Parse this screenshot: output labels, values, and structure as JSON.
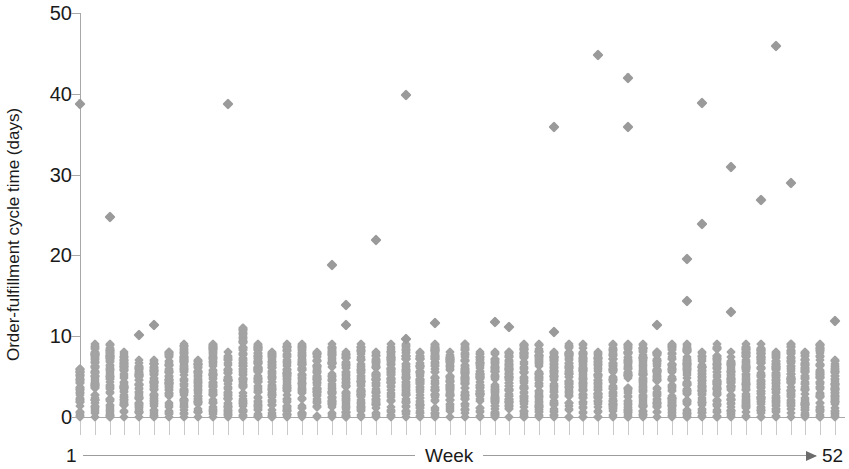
{
  "chart_data": {
    "type": "scatter",
    "title": "",
    "subtitle": "",
    "xlabel": "Week",
    "ylabel": "Order-fulfillment cycle time (days)",
    "xlim": [
      1,
      52
    ],
    "ylim": [
      0,
      50
    ],
    "x_tick_labels": [
      "1",
      "52"
    ],
    "y_tick_labels": [
      "0",
      "10",
      "20",
      "30",
      "40",
      "50"
    ],
    "y_ticks": [
      0,
      10,
      20,
      30,
      40,
      50
    ],
    "grid": false,
    "legend": null,
    "marker": "diamond",
    "marker_color": "#a3a3a3",
    "axis_color": "#a8a8a8",
    "x_axis_arrow": true,
    "cluster_tops": [
      6,
      9,
      9,
      8,
      7,
      7,
      8,
      9,
      7,
      9,
      8,
      11,
      9,
      8,
      9,
      9,
      8,
      9,
      8,
      9,
      8,
      9,
      9,
      8,
      9,
      8,
      9,
      8,
      8,
      8,
      9,
      9,
      8,
      9,
      9,
      8,
      9,
      9,
      9,
      8,
      9,
      9,
      8,
      9,
      8,
      9,
      9,
      8,
      9,
      8,
      9,
      7
    ],
    "series": [
      {
        "name": "Order-fulfillment cycle time",
        "points": [
          {
            "x": 1,
            "y": 38.7
          },
          {
            "x": 3,
            "y": 24.7
          },
          {
            "x": 5,
            "y": 10.2
          },
          {
            "x": 6,
            "y": 11.4
          },
          {
            "x": 11,
            "y": 38.7
          },
          {
            "x": 18,
            "y": 18.8
          },
          {
            "x": 19,
            "y": 13.8
          },
          {
            "x": 19,
            "y": 11.4
          },
          {
            "x": 21,
            "y": 21.9
          },
          {
            "x": 23,
            "y": 9.6
          },
          {
            "x": 23,
            "y": 39.8
          },
          {
            "x": 25,
            "y": 11.6
          },
          {
            "x": 29,
            "y": 11.7
          },
          {
            "x": 30,
            "y": 11.2
          },
          {
            "x": 33,
            "y": 35.9
          },
          {
            "x": 33,
            "y": 10.5
          },
          {
            "x": 36,
            "y": 44.8
          },
          {
            "x": 38,
            "y": 41.9
          },
          {
            "x": 38,
            "y": 35.9
          },
          {
            "x": 40,
            "y": 11.4
          },
          {
            "x": 42,
            "y": 14.4
          },
          {
            "x": 42,
            "y": 19.6
          },
          {
            "x": 43,
            "y": 38.9
          },
          {
            "x": 43,
            "y": 23.9
          },
          {
            "x": 45,
            "y": 30.9
          },
          {
            "x": 45,
            "y": 13.0
          },
          {
            "x": 47,
            "y": 26.9
          },
          {
            "x": 48,
            "y": 45.9
          },
          {
            "x": 49,
            "y": 28.9
          },
          {
            "x": 52,
            "y": 11.9
          }
        ]
      }
    ]
  },
  "axis": {
    "y_title": "Order-fulfillment cycle time (days)",
    "x_left_label": "1",
    "x_center_label": "Week",
    "x_right_label": "52",
    "y_labels": [
      "50",
      "40",
      "30",
      "20",
      "10",
      "0"
    ]
  }
}
